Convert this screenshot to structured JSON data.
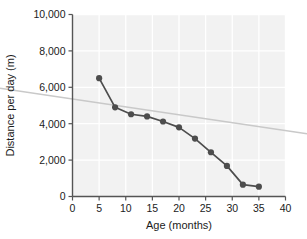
{
  "chart_data": {
    "type": "line",
    "title": "",
    "xlabel": "Age (months)",
    "ylabel": "Distance per day (m)",
    "xlim": [
      0,
      40
    ],
    "ylim": [
      0,
      10000
    ],
    "grid": true,
    "legend": "none",
    "x_ticks": [
      0,
      5,
      10,
      15,
      20,
      25,
      30,
      35,
      40
    ],
    "x_tick_labels": [
      "0",
      "5",
      "10",
      "15",
      "20",
      "25",
      "30",
      "35",
      "40"
    ],
    "y_ticks": [
      0,
      2000,
      4000,
      6000,
      8000,
      10000
    ],
    "y_tick_labels": [
      "0",
      "2,000",
      "4,000",
      "6,000",
      "8,000",
      "10,000"
    ],
    "series": [
      {
        "name": "Distance per day",
        "style": "line-with-markers",
        "color": "#4d4d4d",
        "marker": "circle",
        "x": [
          5,
          8,
          11,
          14,
          17,
          20,
          23,
          26,
          29,
          32,
          35
        ],
        "y": [
          6500,
          4900,
          4520,
          4400,
          4120,
          3800,
          3180,
          2430,
          1680,
          650,
          540
        ]
      },
      {
        "name": "Trend line",
        "style": "line",
        "color": "#c9c9c9",
        "marker": "none",
        "x": [
          -6,
          40
        ],
        "y": [
          5620,
          3620
        ]
      }
    ],
    "plot_background": "#f2f2f2",
    "gridline_color": "#ffffff",
    "axis_color": "#555555"
  },
  "axes": {
    "x_axis_title": "Age (months)",
    "y_axis_title": "Distance per day (m)"
  }
}
